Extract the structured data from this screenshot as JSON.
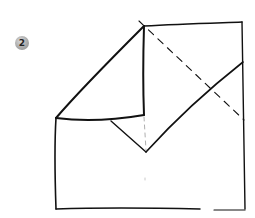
{
  "diagram": {
    "step": {
      "number": "2",
      "badge_color": "#a6a6a6"
    },
    "stroke_color": "#111111",
    "fold_lines": {
      "solid": [
        "square-outline-right-and-top",
        "folded-flap-left-diagonal",
        "flap-vertical-center-edge",
        "flap-horizontal-bottom-edge",
        "inner-v-fold",
        "right-diagonal-edge"
      ],
      "dashed": [
        "valley-fold-diagonal",
        "center-crease-vertical"
      ]
    }
  }
}
